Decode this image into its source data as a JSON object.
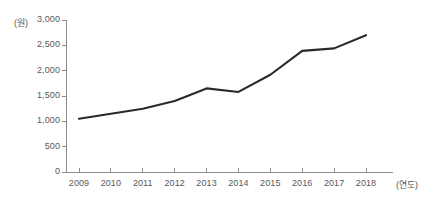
{
  "chart_data": {
    "type": "line",
    "title": "",
    "xlabel": "(연도)",
    "ylabel": "(원)",
    "categories": [
      "2009",
      "2010",
      "2011",
      "2012",
      "2013",
      "2014",
      "2015",
      "2016",
      "2017",
      "2018"
    ],
    "values": [
      1050,
      1150,
      1250,
      1400,
      1650,
      1580,
      1920,
      2390,
      2440,
      2700
    ],
    "series": [
      {
        "name": "",
        "values": [
          1050,
          1150,
          1250,
          1400,
          1650,
          1580,
          1920,
          2390,
          2440,
          2700
        ]
      }
    ],
    "ylim": [
      0,
      3000
    ],
    "ytick_values": [
      0,
      500,
      1000,
      1500,
      2000,
      2500,
      3000
    ],
    "ytick_labels": [
      "0",
      "500",
      "1,000",
      "1,500",
      "2,000",
      "2,500",
      "3,000"
    ],
    "grid": false,
    "legend": "none",
    "line_color": "#2a2a2e",
    "axis_color": "#8a8a90",
    "text_color": "#58585c",
    "background": "#ffffff"
  },
  "axes": {
    "y_unit": "(원)",
    "x_unit": "(연도)"
  }
}
